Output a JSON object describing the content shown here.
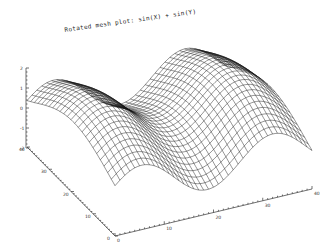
{
  "chart_data": {
    "type": "surface-mesh",
    "title": "Rotated mesh plot: sin(X) + sin(Y)",
    "function": "z = sin(X) + sin(Y)",
    "grid": {
      "nx": 40,
      "ny": 24
    },
    "x_axis": {
      "ticks": [
        "0",
        "10",
        "20",
        "30",
        "40"
      ],
      "range": [
        0,
        40
      ]
    },
    "y_axis": {
      "ticks": [
        "0",
        "10",
        "20",
        "30",
        "40"
      ],
      "range": [
        0,
        40
      ]
    },
    "z_axis": {
      "ticks": [
        "-2",
        "-1",
        "0",
        "1",
        "2"
      ],
      "range": [
        -2,
        2
      ]
    },
    "line_color": "#111111",
    "background": "#ffffff"
  }
}
